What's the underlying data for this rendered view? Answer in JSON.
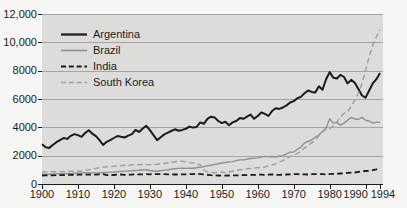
{
  "colors": {
    "page_bg": "#f6f6f4",
    "plot_bg": "#dcdcda",
    "grid": "#a5a5a5",
    "axis": "#1c1c1c",
    "text": "#1c1c1c",
    "argentina": "#1a1a1a",
    "brazil": "#8f8f8f",
    "india": "#1a1a1a",
    "south_korea": "#9e9e9e"
  },
  "chart_data": {
    "type": "line",
    "title": "",
    "xlabel": "",
    "ylabel": "",
    "x_start": 1900,
    "x_end": 1994,
    "x_step": 1,
    "ylim": [
      0,
      12000
    ],
    "grid": "horizontal",
    "legend_position": "top-left",
    "yticks": [
      {
        "value": 0,
        "label": "0"
      },
      {
        "value": 2000,
        "label": "2000"
      },
      {
        "value": 4000,
        "label": "4000"
      },
      {
        "value": 6000,
        "label": "6000"
      },
      {
        "value": 8000,
        "label": "8000"
      },
      {
        "value": 10000,
        "label": "10,000"
      },
      {
        "value": 12000,
        "label": "12,000"
      }
    ],
    "xticks": [
      {
        "value": 1900,
        "label": "1900"
      },
      {
        "value": 1910,
        "label": "1910"
      },
      {
        "value": 1920,
        "label": "1920"
      },
      {
        "value": 1930,
        "label": "1930"
      },
      {
        "value": 1940,
        "label": "1940"
      },
      {
        "value": 1950,
        "label": "1950"
      },
      {
        "value": 1960,
        "label": "1960"
      },
      {
        "value": 1970,
        "label": "1970"
      },
      {
        "value": 1980,
        "label": "1980"
      },
      {
        "value": 1990,
        "label": "1990"
      },
      {
        "value": 1994,
        "label": "1994"
      }
    ],
    "series": [
      {
        "name": "Argentina",
        "color": "#1a1a1a",
        "dash": "solid",
        "width": 2,
        "values": [
          2800,
          2600,
          2550,
          2750,
          2950,
          3100,
          3250,
          3180,
          3400,
          3520,
          3450,
          3330,
          3600,
          3800,
          3550,
          3380,
          3100,
          2750,
          2980,
          3100,
          3250,
          3390,
          3330,
          3280,
          3420,
          3520,
          3810,
          3680,
          3920,
          4100,
          3800,
          3450,
          3100,
          3300,
          3500,
          3620,
          3740,
          3860,
          3760,
          3820,
          3900,
          4050,
          3980,
          4020,
          4350,
          4250,
          4600,
          4750,
          4700,
          4450,
          4300,
          4400,
          4150,
          4350,
          4450,
          4650,
          4600,
          4750,
          4900,
          4600,
          4800,
          5050,
          4950,
          4800,
          5150,
          5350,
          5300,
          5400,
          5550,
          5750,
          5850,
          6050,
          6150,
          6400,
          6600,
          6500,
          6450,
          6900,
          6650,
          7400,
          7900,
          7500,
          7450,
          7700,
          7550,
          7100,
          7350,
          7150,
          6700,
          6250,
          6100,
          6600,
          7100,
          7400,
          7830
        ]
      },
      {
        "name": "Brazil",
        "color": "#8f8f8f",
        "dash": "solid",
        "width": 1.4,
        "values": [
          700,
          695,
          690,
          700,
          710,
          720,
          730,
          740,
          750,
          760,
          770,
          780,
          790,
          800,
          780,
          780,
          800,
          820,
          810,
          840,
          850,
          860,
          890,
          910,
          920,
          930,
          950,
          970,
          1000,
          1000,
          950,
          920,
          900,
          940,
          980,
          1000,
          1050,
          1080,
          1100,
          1120,
          1100,
          1120,
          1110,
          1150,
          1200,
          1220,
          1300,
          1330,
          1380,
          1430,
          1480,
          1520,
          1560,
          1580,
          1650,
          1700,
          1700,
          1750,
          1800,
          1830,
          1840,
          1900,
          1950,
          1930,
          1940,
          1900,
          1980,
          2000,
          2120,
          2250,
          2260,
          2450,
          2600,
          2900,
          3000,
          3110,
          3300,
          3450,
          3700,
          3950,
          4600,
          4300,
          4350,
          4150,
          4300,
          4500,
          4700,
          4600,
          4550,
          4700,
          4500,
          4450,
          4300,
          4350,
          4350
        ]
      },
      {
        "name": "India",
        "color": "#1a1a1a",
        "dash": "dashed",
        "width": 1.8,
        "values": [
          600,
          605,
          610,
          615,
          620,
          625,
          630,
          635,
          645,
          650,
          655,
          660,
          660,
          665,
          665,
          665,
          680,
          690,
          620,
          660,
          635,
          665,
          670,
          650,
          665,
          665,
          680,
          675,
          680,
          690,
          685,
          690,
          695,
          700,
          690,
          680,
          675,
          670,
          670,
          680,
          685,
          690,
          700,
          720,
          700,
          680,
          650,
          620,
          610,
          600,
          590,
          595,
          600,
          610,
          615,
          615,
          630,
          625,
          640,
          645,
          655,
          660,
          650,
          655,
          675,
          640,
          650,
          660,
          670,
          680,
          695,
          690,
          680,
          685,
          670,
          695,
          700,
          705,
          690,
          670,
          700,
          715,
          720,
          740,
          760,
          780,
          800,
          810,
          860,
          890,
          920,
          930,
          980,
          1040,
          1100
        ]
      },
      {
        "name": "South Korea",
        "color": "#9e9e9e",
        "dash": "dashed",
        "width": 1.4,
        "values": [
          850,
          855,
          860,
          865,
          870,
          875,
          880,
          890,
          895,
          900,
          905,
          920,
          950,
          1000,
          1050,
          1100,
          1150,
          1180,
          1220,
          1240,
          1250,
          1270,
          1300,
          1320,
          1300,
          1350,
          1380,
          1360,
          1400,
          1380,
          1350,
          1380,
          1400,
          1420,
          1450,
          1500,
          1530,
          1570,
          1600,
          1620,
          1550,
          1520,
          1500,
          1450,
          1350,
          1000,
          850,
          820,
          800,
          830,
          850,
          800,
          850,
          900,
          950,
          1000,
          1020,
          1080,
          1100,
          1120,
          1150,
          1160,
          1200,
          1280,
          1350,
          1420,
          1550,
          1650,
          1800,
          1950,
          2000,
          2150,
          2300,
          2550,
          2700,
          2900,
          3100,
          3400,
          3700,
          3850,
          3900,
          4100,
          4400,
          4700,
          5000,
          5100,
          5500,
          5900,
          6400,
          7100,
          8000,
          9000,
          9800,
          10400,
          10900
        ]
      }
    ]
  }
}
